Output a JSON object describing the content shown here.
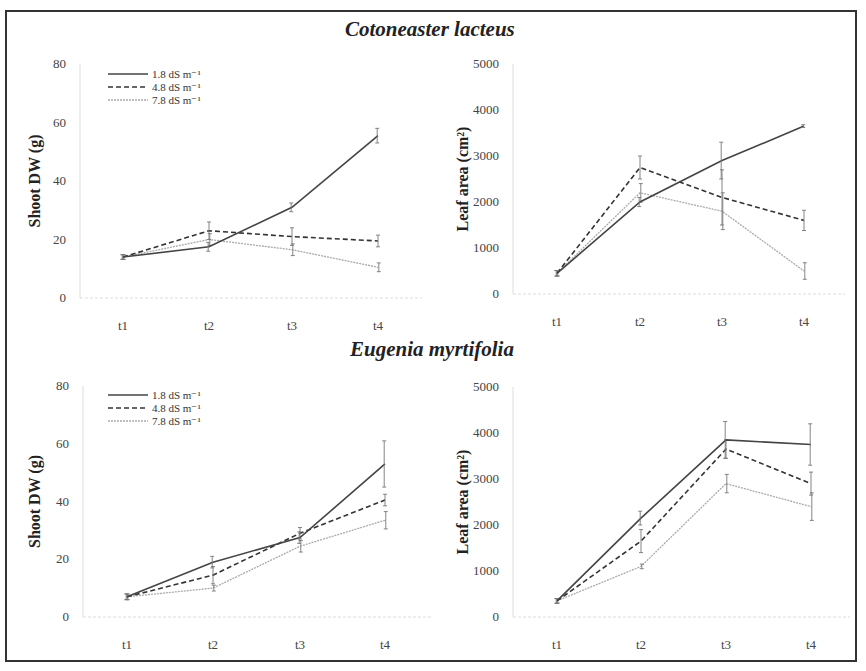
{
  "figure": {
    "titles": [
      "Cotoneaster lacteus",
      "Eugenia myrtifolia"
    ],
    "legend": [
      "1.8 dS m⁻¹",
      "4.8 dS m⁻¹",
      "7.8 dS m⁻¹"
    ]
  },
  "chart_data": [
    {
      "type": "line",
      "title": "Cotoneaster lacteus",
      "xlabel": "",
      "ylabel": "Shoot DW (g)",
      "categories": [
        "t1",
        "t2",
        "t3",
        "t4"
      ],
      "ylim": [
        0,
        80
      ],
      "yticks": [
        0,
        20,
        40,
        60,
        80
      ],
      "legend_position": "upper left",
      "series": [
        {
          "name": "1.8 dS m-1",
          "style": "solid",
          "values": [
            14,
            17.5,
            31,
            55.5
          ],
          "err": [
            0.8,
            1.5,
            1.5,
            2.5
          ]
        },
        {
          "name": "4.8 dS m-1",
          "style": "dashed",
          "values": [
            14,
            23,
            21,
            19.5
          ],
          "err": [
            0.8,
            3,
            3,
            2
          ]
        },
        {
          "name": "7.8 dS m-1",
          "style": "dotted",
          "values": [
            14,
            20,
            16.5,
            10.5
          ],
          "err": [
            0.8,
            2,
            2,
            1.5
          ]
        }
      ]
    },
    {
      "type": "line",
      "title": "Cotoneaster lacteus",
      "xlabel": "",
      "ylabel": "Leaf area (cm²)",
      "categories": [
        "t1",
        "t2",
        "t3",
        "t4"
      ],
      "ylim": [
        0,
        5000
      ],
      "yticks": [
        0,
        1000,
        2000,
        3000,
        4000,
        5000
      ],
      "series": [
        {
          "name": "1.8 dS m-1",
          "style": "solid",
          "values": [
            450,
            2000,
            2900,
            3650
          ],
          "err": [
            60,
            100,
            400,
            30
          ]
        },
        {
          "name": "4.8 dS m-1",
          "style": "dashed",
          "values": [
            450,
            2750,
            2100,
            1600
          ],
          "err": [
            60,
            250,
            600,
            220
          ]
        },
        {
          "name": "7.8 dS m-1",
          "style": "dotted",
          "values": [
            450,
            2200,
            1800,
            500
          ],
          "err": [
            60,
            200,
            400,
            180
          ]
        }
      ]
    },
    {
      "type": "line",
      "title": "Eugenia myrtifolia",
      "xlabel": "",
      "ylabel": "Shoot DW (g)",
      "categories": [
        "t1",
        "t2",
        "t3",
        "t4"
      ],
      "ylim": [
        0,
        80
      ],
      "yticks": [
        0,
        20,
        40,
        60,
        80
      ],
      "legend_position": "upper left",
      "series": [
        {
          "name": "1.8 dS m-1",
          "style": "solid",
          "values": [
            7,
            19,
            27.5,
            53
          ],
          "err": [
            1,
            2,
            2,
            8
          ]
        },
        {
          "name": "4.8 dS m-1",
          "style": "dashed",
          "values": [
            7,
            14.5,
            29,
            40.5
          ],
          "err": [
            1,
            3,
            2,
            2
          ]
        },
        {
          "name": "7.8 dS m-1",
          "style": "dotted",
          "values": [
            7,
            10,
            24.5,
            33.5
          ],
          "err": [
            1,
            1,
            2,
            3
          ]
        }
      ]
    },
    {
      "type": "line",
      "title": "Eugenia myrtifolia",
      "xlabel": "",
      "ylabel": "Leaf area (cm²)",
      "categories": [
        "t1",
        "t2",
        "t3",
        "t4"
      ],
      "ylim": [
        0,
        5000
      ],
      "yticks": [
        0,
        1000,
        2000,
        3000,
        4000,
        5000
      ],
      "series": [
        {
          "name": "1.8 dS m-1",
          "style": "solid",
          "values": [
            350,
            2150,
            3850,
            3750
          ],
          "err": [
            50,
            150,
            400,
            450
          ]
        },
        {
          "name": "4.8 dS m-1",
          "style": "dashed",
          "values": [
            350,
            1650,
            3650,
            2900
          ],
          "err": [
            50,
            250,
            200,
            250
          ]
        },
        {
          "name": "7.8 dS m-1",
          "style": "dotted",
          "values": [
            350,
            1100,
            2900,
            2400
          ],
          "err": [
            50,
            50,
            200,
            300
          ]
        }
      ]
    }
  ]
}
